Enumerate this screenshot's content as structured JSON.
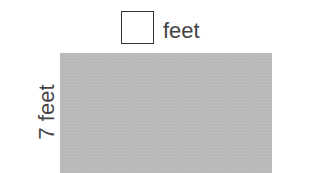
{
  "diagram": {
    "type": "rectangle-area",
    "width_label": {
      "value": "",
      "unit": "feet",
      "is_blank": true
    },
    "height_label": {
      "value": "7",
      "unit": "feet",
      "text": "7 feet"
    },
    "fill_color": "#b9b9b9"
  },
  "labels": {
    "top_unit": "feet",
    "side": "7 feet"
  }
}
